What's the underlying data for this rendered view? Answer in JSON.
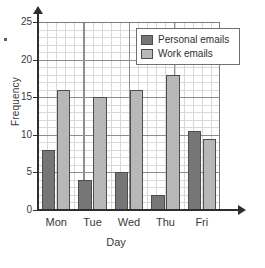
{
  "chart_data": {
    "type": "bar",
    "title": "",
    "xlabel": "Day",
    "ylabel": "Frequency",
    "categories": [
      "Mon",
      "Tue",
      "Wed",
      "Thu",
      "Fri"
    ],
    "series": [
      {
        "name": "Personal emails",
        "values": [
          8,
          4,
          5,
          2,
          10.5
        ],
        "color": "#767676"
      },
      {
        "name": "Work emails",
        "values": [
          16,
          15,
          16,
          18,
          9.5
        ],
        "color": "#b8b8b8"
      }
    ],
    "ylim": [
      0,
      25
    ],
    "yticks": [
      0,
      5,
      10,
      15,
      20,
      25
    ],
    "ytick_labels": [
      "0",
      "5",
      "10",
      "15",
      "20",
      "25"
    ],
    "minor_tick_step": 1,
    "grid": true,
    "legend_position": "top-right"
  },
  "legend": {
    "entries": [
      {
        "label": "Personal emails",
        "swatch": "#767676"
      },
      {
        "label": "Work emails",
        "swatch": "#b8b8b8"
      }
    ]
  },
  "axes": {
    "y_title": "Frequency",
    "x_title": "Day",
    "y_labels": [
      "25",
      "20",
      "15",
      "10",
      "5",
      "0"
    ],
    "x_labels": [
      "Mon",
      "Tue",
      "Wed",
      "Thu",
      "Fri"
    ]
  },
  "colors": {
    "personal": "#767676",
    "work": "#b8b8b8",
    "axis": "#2e2e2e",
    "grid_major": "#8e8e8e",
    "grid_minor": "#d2d2d2",
    "bar_outline": "#4d4d4d"
  }
}
